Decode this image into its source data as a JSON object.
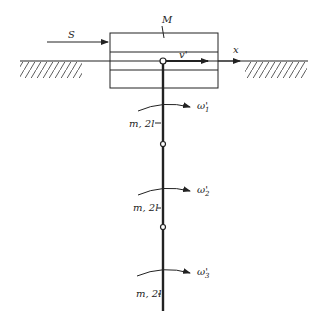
{
  "diagram": {
    "labels": {
      "mass_block": "M",
      "force": "S",
      "velocity": "v'",
      "axis": "x",
      "omega1": "ω'",
      "omega1_sub": "1",
      "omega2": "ω'",
      "omega2_sub": "2",
      "omega3": "ω'",
      "omega3_sub": "3",
      "segment1": "m, 2l",
      "segment2": "m, 2l",
      "segment3": "m, 2l"
    },
    "colors": {
      "ink": "#222222",
      "background": "#ffffff"
    }
  }
}
